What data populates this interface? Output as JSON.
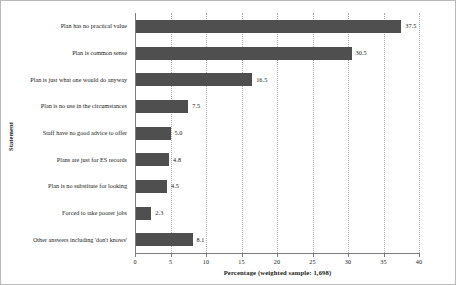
{
  "chart_data": {
    "type": "bar",
    "orientation": "horizontal",
    "title": "",
    "xlabel": "Percentage (weighted sample: 1,698)",
    "ylabel": "Statement",
    "xlim": [
      0,
      40
    ],
    "xticks": [
      0,
      5,
      10,
      15,
      20,
      25,
      30,
      35,
      40
    ],
    "xticklabels": [
      "0",
      "5",
      "10",
      "15",
      "20",
      "25",
      "30",
      "35",
      "40"
    ],
    "grid": "vertical-dotted",
    "legend": "none",
    "bar_color": "#4f4f4f",
    "categories": [
      "Plan has no practical value",
      "Plan is common sense",
      "Plan is just what one would do anyway",
      "Plan is no use in the circumstances",
      "Staff have no good advice to offer",
      "Plans are just for ES records",
      "Plan is no substitute for looking",
      "Forced to take poorer jobs",
      "Other answers including 'don't knows'"
    ],
    "values": [
      37.5,
      30.5,
      16.5,
      7.5,
      5.0,
      4.8,
      4.5,
      2.3,
      8.1
    ],
    "value_labels": [
      "37.5",
      "30.5",
      "16.5",
      "7.5",
      "5.0",
      "4.8",
      "4.5",
      "2.3",
      "8.1"
    ]
  }
}
